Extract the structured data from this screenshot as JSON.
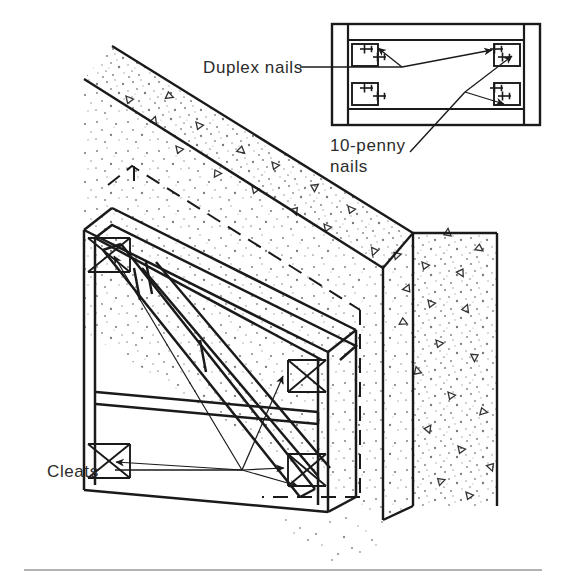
{
  "figure": {
    "type": "isometric-technical-illustration",
    "background_color": "#ffffff",
    "ink_color": "#1a1a1a",
    "text_color": "#2b2b2b",
    "stipple_color": "#7a7a7a",
    "aggregate_color": "#3a3a3a"
  },
  "labels": {
    "duplex_nails": "Duplex nails",
    "ten_penny_nails_line1": "10-penny",
    "ten_penny_nails_line2": "nails",
    "cleats": "Cleats"
  },
  "inset_detail": {
    "name": "plan-view-nailing-detail",
    "x": 332,
    "y": 24,
    "width": 208,
    "height": 101,
    "corner_count": 4,
    "corner_fastener_symbol": "nail-bracket"
  },
  "main_view": {
    "name": "isometric-blockout-in-concrete-wall",
    "wall_faces": [
      "top",
      "front",
      "right-end"
    ],
    "opening_frame_members": [
      "head",
      "sill",
      "jamb-left",
      "jamb-right"
    ],
    "braces": [
      "diagonal-brace-upper",
      "diagonal-brace-lower",
      "horizontal-strut"
    ],
    "cleat_positions": [
      "top-left",
      "bottom-left",
      "top-right",
      "bottom-right"
    ],
    "hidden_line_style": "dashed"
  },
  "footer_rule": {
    "name": "bottom-divider",
    "y": 570,
    "color": "#999999"
  }
}
